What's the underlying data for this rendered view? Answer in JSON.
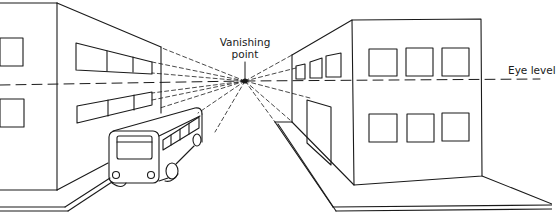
{
  "diagram": {
    "type": "one-point-perspective",
    "labels": {
      "vanishing_point_line1": "Vanishing",
      "vanishing_point_line2": "point",
      "eye_level": "Eye level"
    },
    "vanishing_point": {
      "x": 245,
      "y": 81
    },
    "eye_level_y": 82,
    "elements": [
      "left-building",
      "bus",
      "right-building",
      "left-sidewalk",
      "right-sidewalk",
      "perspective-guide-lines"
    ],
    "colors": {
      "line": "#1a1a1a",
      "background": "#ffffff"
    }
  }
}
